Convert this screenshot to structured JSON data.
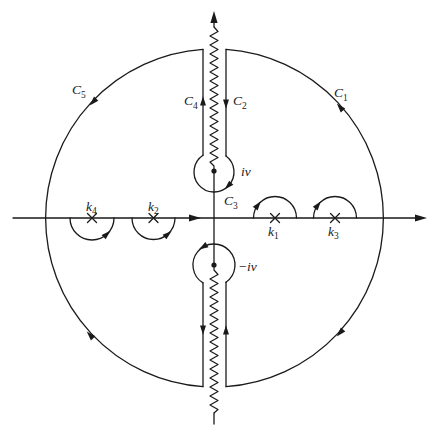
{
  "diagram": {
    "type": "complex-plane integration contour",
    "contours": {
      "C1": {
        "letter": "C",
        "sub": "1"
      },
      "C2": {
        "letter": "C",
        "sub": "2"
      },
      "C3": {
        "letter": "C",
        "sub": "3"
      },
      "C4": {
        "letter": "C",
        "sub": "4"
      },
      "C5": {
        "letter": "C",
        "sub": "5"
      }
    },
    "poles_on_real_axis": [
      {
        "id": "k4",
        "letter": "k",
        "sub": "4",
        "side": "negative",
        "indent": "below"
      },
      {
        "id": "k2",
        "letter": "k",
        "sub": "2",
        "side": "negative",
        "indent": "below"
      },
      {
        "id": "k1",
        "letter": "k",
        "sub": "1",
        "side": "positive",
        "indent": "above"
      },
      {
        "id": "k3",
        "letter": "k",
        "sub": "3",
        "side": "positive",
        "indent": "above"
      }
    ],
    "branch_points": {
      "upper": "iv",
      "lower": "−iv"
    },
    "branch_cuts": [
      "from iv to +i∞ (zigzag)",
      "from −iv to −i∞ (zigzag)"
    ]
  },
  "colors": {
    "stroke": "#1a1a1a",
    "background": "#ffffff"
  }
}
